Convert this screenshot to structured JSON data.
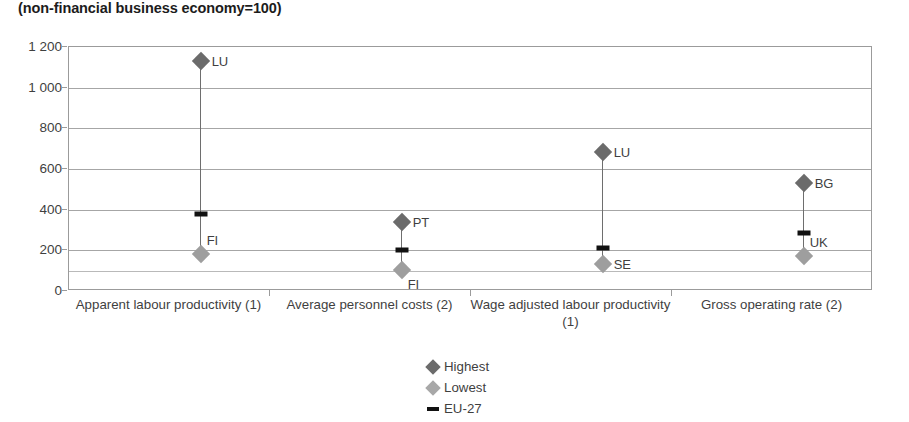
{
  "chart_data": {
    "type": "scatter",
    "title": "(non-financial business economy=100)",
    "xlabel": "",
    "ylabel": "",
    "ylim": [
      0,
      1200
    ],
    "yticks": [
      0,
      200,
      400,
      600,
      800,
      1000,
      1200
    ],
    "ytick_labels": [
      "0",
      "200",
      "400",
      "600",
      "800",
      "1 000",
      "1 200"
    ],
    "grid": true,
    "minor_gridlines": [
      100
    ],
    "legend_position": "bottom-center",
    "legend": [
      {
        "name": "Highest",
        "marker": "diamond",
        "color": "#6b6b6b"
      },
      {
        "name": "Lowest",
        "marker": "diamond",
        "color": "#a8a8a8"
      },
      {
        "name": "EU-27",
        "marker": "dash",
        "color": "#111111"
      }
    ],
    "categories": [
      "Apparent labour productivity (1)",
      "Average personnel costs (2)",
      "Wage adjusted labour productivity (1)",
      "Gross operating rate (2)"
    ],
    "series": [
      {
        "name": "Highest",
        "values": [
          1130,
          340,
          685,
          530
        ]
      },
      {
        "name": "Lowest",
        "values": [
          180,
          105,
          135,
          172
        ]
      },
      {
        "name": "EU-27",
        "values": [
          380,
          200,
          210,
          285
        ]
      }
    ],
    "points": [
      {
        "category": "Apparent labour productivity (1)",
        "highest": {
          "code": "LU",
          "value": 1130
        },
        "lowest": {
          "code": "FI",
          "value": 180
        },
        "eu27": {
          "value": 380
        }
      },
      {
        "category": "Average personnel costs (2)",
        "highest": {
          "code": "PT",
          "value": 340
        },
        "lowest": {
          "code": "FI",
          "value": 105
        },
        "eu27": {
          "value": 200
        }
      },
      {
        "category": "Wage adjusted labour productivity (1)",
        "highest": {
          "code": "LU",
          "value": 685
        },
        "lowest": {
          "code": "SE",
          "value": 135
        },
        "eu27": {
          "value": 210
        }
      },
      {
        "category": "Gross operating rate (2)",
        "highest": {
          "code": "BG",
          "value": 530
        },
        "lowest": {
          "code": "UK",
          "value": 172
        },
        "eu27": {
          "value": 285
        }
      }
    ]
  },
  "colors": {
    "highest": "#6b6b6b",
    "lowest": "#a8a8a8",
    "eu27": "#111111",
    "gridline": "#a6a6a6",
    "frame": "#9b9b9b",
    "text": "#3f3f3f"
  }
}
